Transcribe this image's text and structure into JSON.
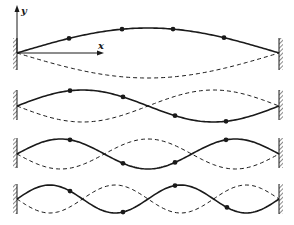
{
  "figure": {
    "axis_labels": {
      "y": "y",
      "x": "x"
    },
    "colors": {
      "ink": "#1a1a1a",
      "background": "#ffffff"
    },
    "string": {
      "x_start": 17,
      "x_end": 279
    },
    "modes": [
      {
        "n": 1,
        "baseline_y": 53,
        "amplitude": 25,
        "wall_top": 38,
        "wall_bottom": 70,
        "dots_x": [
          69,
          122,
          173,
          224
        ]
      },
      {
        "n": 2,
        "baseline_y": 106,
        "amplitude": 16,
        "wall_top": 90,
        "wall_bottom": 120,
        "dots_x": [
          70,
          123,
          175,
          226
        ]
      },
      {
        "n": 3,
        "baseline_y": 154,
        "amplitude": 15,
        "wall_top": 138,
        "wall_bottom": 168,
        "dots_x": [
          70,
          123,
          175,
          226
        ]
      },
      {
        "n": 4,
        "baseline_y": 199,
        "amplitude": 14,
        "wall_top": 184,
        "wall_bottom": 214,
        "dots_x": [
          70,
          123,
          175,
          227
        ]
      }
    ]
  }
}
